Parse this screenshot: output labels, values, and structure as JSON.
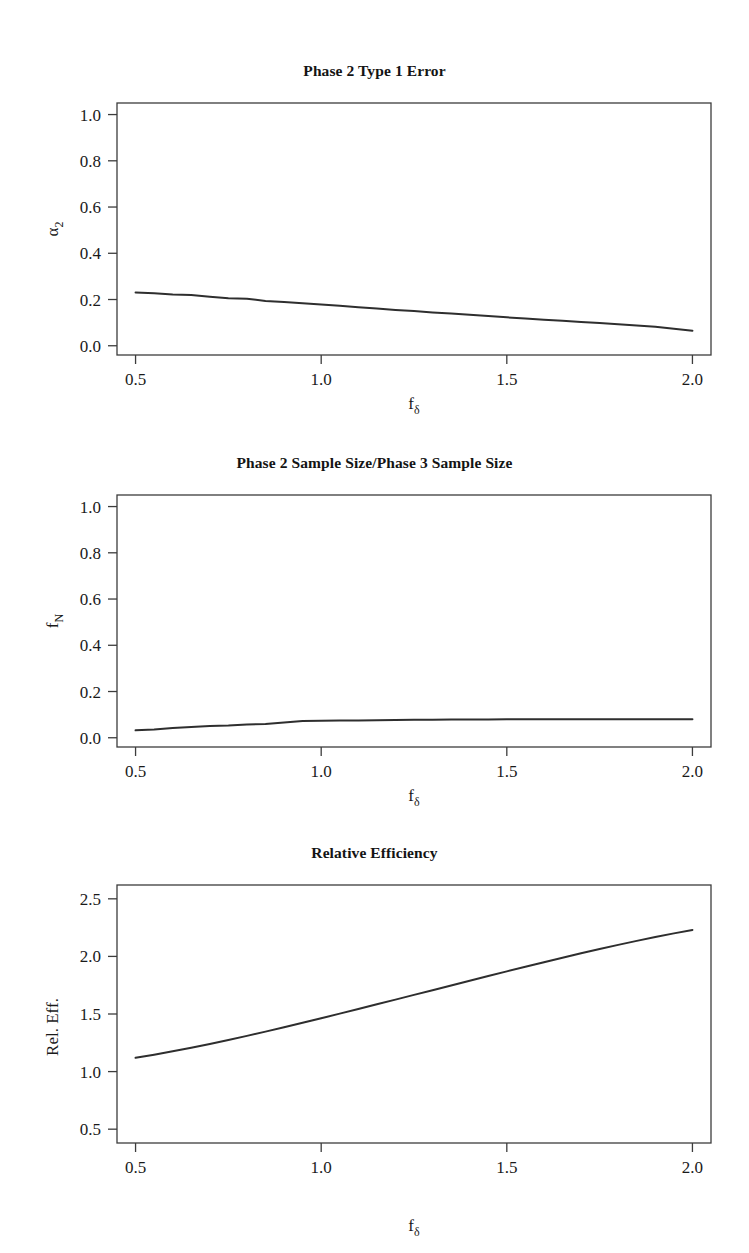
{
  "figure": {
    "background": "#ffffff",
    "line_color": "#2e2e2e",
    "frame_color": "#3c3c3c",
    "width": 749,
    "height": 1253
  },
  "chart_data": [
    {
      "type": "line",
      "title": "Phase 2 Type 1 Error",
      "xlabel": "f",
      "xlabel_sub": "δ",
      "ylabel": "α",
      "ylabel_sub": "2",
      "xlim": [
        0.45,
        2.05
      ],
      "ylim": [
        -0.04,
        1.05
      ],
      "xticks": [
        0.5,
        1.0,
        1.5,
        2.0
      ],
      "xticklabels": [
        "0.5",
        "1.0",
        "1.5",
        "2.0"
      ],
      "yticks": [
        0.0,
        0.2,
        0.4,
        0.6,
        0.8,
        1.0
      ],
      "yticklabels": [
        "0.0",
        "0.2",
        "0.4",
        "0.6",
        "0.8",
        "1.0"
      ],
      "grid": false,
      "legend": "none",
      "x": [
        0.5,
        0.55,
        0.6,
        0.65,
        0.7,
        0.75,
        0.8,
        0.85,
        0.9,
        0.95,
        1.0,
        1.05,
        1.1,
        1.15,
        1.2,
        1.25,
        1.3,
        1.35,
        1.4,
        1.45,
        1.5,
        1.55,
        1.6,
        1.65,
        1.7,
        1.75,
        1.8,
        1.85,
        1.9,
        1.95,
        2.0
      ],
      "y": [
        0.23,
        0.227,
        0.222,
        0.219,
        0.212,
        0.206,
        0.203,
        0.194,
        0.189,
        0.184,
        0.178,
        0.173,
        0.167,
        0.161,
        0.155,
        0.15,
        0.144,
        0.139,
        0.134,
        0.129,
        0.123,
        0.118,
        0.113,
        0.108,
        0.103,
        0.098,
        0.093,
        0.088,
        0.082,
        0.074,
        0.065
      ]
    },
    {
      "type": "line",
      "title": "Phase 2 Sample Size/Phase 3 Sample Size",
      "xlabel": "f",
      "xlabel_sub": "δ",
      "ylabel": "f",
      "ylabel_sub": "N",
      "xlim": [
        0.45,
        2.05
      ],
      "ylim": [
        -0.04,
        1.05
      ],
      "xticks": [
        0.5,
        1.0,
        1.5,
        2.0
      ],
      "xticklabels": [
        "0.5",
        "1.0",
        "1.5",
        "2.0"
      ],
      "yticks": [
        0.0,
        0.2,
        0.4,
        0.6,
        0.8,
        1.0
      ],
      "yticklabels": [
        "0.0",
        "0.2",
        "0.4",
        "0.6",
        "0.8",
        "1.0"
      ],
      "grid": false,
      "legend": "none",
      "x": [
        0.5,
        0.55,
        0.6,
        0.65,
        0.7,
        0.75,
        0.8,
        0.85,
        0.9,
        0.95,
        1.0,
        1.05,
        1.1,
        1.15,
        1.2,
        1.25,
        1.3,
        1.35,
        1.4,
        1.45,
        1.5,
        1.55,
        1.6,
        1.65,
        1.7,
        1.75,
        1.8,
        1.85,
        1.9,
        1.95,
        2.0
      ],
      "y": [
        0.032,
        0.036,
        0.042,
        0.047,
        0.051,
        0.053,
        0.057,
        0.06,
        0.066,
        0.073,
        0.074,
        0.075,
        0.075,
        0.076,
        0.077,
        0.078,
        0.078,
        0.079,
        0.079,
        0.079,
        0.08,
        0.08,
        0.08,
        0.08,
        0.08,
        0.08,
        0.08,
        0.08,
        0.08,
        0.08,
        0.08
      ]
    },
    {
      "type": "line",
      "title": "Relative Efficiency",
      "xlabel": "f",
      "xlabel_sub": "δ",
      "ylabel": "Rel. Eff.",
      "ylabel_sub": "",
      "xlim": [
        0.45,
        2.05
      ],
      "ylim": [
        0.38,
        2.62
      ],
      "xticks": [
        0.5,
        1.0,
        1.5,
        2.0
      ],
      "xticklabels": [
        "0.5",
        "1.0",
        "1.5",
        "2.0"
      ],
      "yticks": [
        0.5,
        1.0,
        1.5,
        2.0,
        2.5
      ],
      "yticklabels": [
        "0.5",
        "1.0",
        "1.5",
        "2.0",
        "2.5"
      ],
      "grid": false,
      "legend": "none",
      "x": [
        0.5,
        0.55,
        0.6,
        0.65,
        0.7,
        0.75,
        0.8,
        0.85,
        0.9,
        0.95,
        1.0,
        1.05,
        1.1,
        1.15,
        1.2,
        1.25,
        1.3,
        1.35,
        1.4,
        1.45,
        1.5,
        1.55,
        1.6,
        1.65,
        1.7,
        1.75,
        1.8,
        1.85,
        1.9,
        1.95,
        2.0
      ],
      "y": [
        1.12,
        1.147,
        1.176,
        1.207,
        1.24,
        1.274,
        1.31,
        1.347,
        1.385,
        1.424,
        1.463,
        1.503,
        1.543,
        1.584,
        1.625,
        1.666,
        1.707,
        1.748,
        1.789,
        1.83,
        1.87,
        1.91,
        1.95,
        1.989,
        2.027,
        2.064,
        2.1,
        2.135,
        2.168,
        2.2,
        2.23
      ]
    }
  ]
}
